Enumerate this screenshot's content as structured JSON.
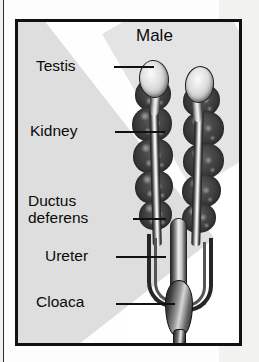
{
  "figure": {
    "title": "Male",
    "labels": [
      {
        "id": "testis",
        "text": "Testis",
        "lines": [
          "Testis"
        ]
      },
      {
        "id": "kidney",
        "text": "Kidney",
        "lines": [
          "Kidney"
        ]
      },
      {
        "id": "ductus",
        "text": "Ductus deferens",
        "lines": [
          "Ductus",
          "deferens"
        ]
      },
      {
        "id": "ureter",
        "text": "Ureter",
        "lines": [
          "Ureter"
        ]
      },
      {
        "id": "cloaca",
        "text": "Cloaca",
        "lines": [
          "Cloaca"
        ]
      }
    ],
    "label_text": {
      "testis": "Testis",
      "kidney": "Kidney",
      "ductus_line1": "Ductus",
      "ductus_line2": "deferens",
      "ureter": "Ureter",
      "cloaca": "Cloaca"
    },
    "colors": {
      "border": "#111111",
      "panel_background": "#ffffff",
      "page_background": "#f2f2f0",
      "shadow_band": "#dedede",
      "text": "#0a0a0a",
      "kidney_dark": "#3a3a3a",
      "testis_light": "#dcdcdc",
      "duct_light": "#efefef",
      "cloaca_dark": "#1c1c1c"
    },
    "structures": {
      "testes_count": 2,
      "kidney_lobes_per_side": 5,
      "ducts_count": 2
    }
  }
}
